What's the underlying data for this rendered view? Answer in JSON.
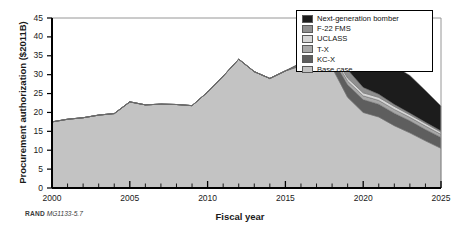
{
  "figure": {
    "credit_org": "RAND",
    "credit_code": "MG1133-5.7"
  },
  "chart_data": {
    "type": "area",
    "stacked": true,
    "title": "",
    "xlabel": "Fiscal year",
    "ylabel": "Procurement authorization ($2011B)",
    "xlim": [
      2000,
      2025
    ],
    "ylim": [
      0,
      45
    ],
    "ytick_values": [
      0,
      5,
      10,
      15,
      20,
      25,
      30,
      35,
      40,
      45
    ],
    "xtick_values": [
      2000,
      2005,
      2010,
      2015,
      2020,
      2025
    ],
    "xtick_labels": [
      "2000",
      "2005",
      "2010",
      "2015",
      "2020",
      "2025"
    ],
    "minor_xticks": "every 1 year",
    "grid": false,
    "legend_position": "top-right",
    "x": [
      2000,
      2001,
      2002,
      2003,
      2004,
      2005,
      2006,
      2007,
      2008,
      2009,
      2010,
      2011,
      2012,
      2013,
      2014,
      2015,
      2016,
      2017,
      2018,
      2019,
      2020,
      2021,
      2022,
      2023,
      2024,
      2025
    ],
    "series": [
      {
        "name": "Base case",
        "color": "#c3c3c3",
        "values": [
          17.5,
          18.2,
          18.6,
          19.3,
          19.7,
          22.8,
          22.0,
          22.2,
          22.1,
          21.8,
          25.4,
          29.6,
          34.1,
          30.8,
          29.0,
          31.0,
          32.3,
          32.5,
          31.9,
          24.0,
          20.0,
          18.8,
          16.5,
          14.6,
          12.5,
          10.5
        ]
      },
      {
        "name": "KC-X",
        "color": "#5e5e5e",
        "values": [
          0,
          0,
          0,
          0,
          0,
          0,
          0,
          0,
          0,
          0,
          0,
          0,
          0,
          0,
          0,
          0,
          0.3,
          1.4,
          2.6,
          3.3,
          3.4,
          3.4,
          3.3,
          3.2,
          3.0,
          2.9
        ]
      },
      {
        "name": "T-X",
        "color": "#a8a8a8",
        "values": [
          0,
          0,
          0,
          0,
          0,
          0,
          0,
          0,
          0,
          0,
          0,
          0,
          0,
          0,
          0,
          0,
          0.1,
          0.5,
          0.9,
          1.0,
          1.0,
          1.0,
          1.0,
          0.9,
          0.9,
          0.8
        ]
      },
      {
        "name": "UCLASS",
        "color": "#d6d6d6",
        "values": [
          0,
          0,
          0,
          0,
          0,
          0,
          0,
          0,
          0,
          0,
          0,
          0,
          0,
          0,
          0,
          0,
          0.1,
          0.4,
          0.7,
          0.8,
          0.8,
          0.8,
          0.8,
          0.7,
          0.7,
          0.6
        ]
      },
      {
        "name": "F-22 FMS",
        "color": "#8f8f8f",
        "values": [
          0,
          0,
          0,
          0,
          0,
          0,
          0,
          0,
          0,
          0,
          0,
          0,
          0,
          0,
          0,
          0,
          0.2,
          1.1,
          2.0,
          2.2,
          1.4,
          0.8,
          0.5,
          0.4,
          0.3,
          0.3
        ]
      },
      {
        "name": "Next-generation bomber",
        "color": "#1c1c1c",
        "values": [
          0,
          0,
          0,
          0,
          0,
          0,
          0,
          0,
          0,
          0,
          0,
          0,
          0,
          0,
          0,
          0,
          0.2,
          1.0,
          2.4,
          4.6,
          6.6,
          8.4,
          10.2,
          10.0,
          8.4,
          6.6
        ]
      }
    ]
  }
}
